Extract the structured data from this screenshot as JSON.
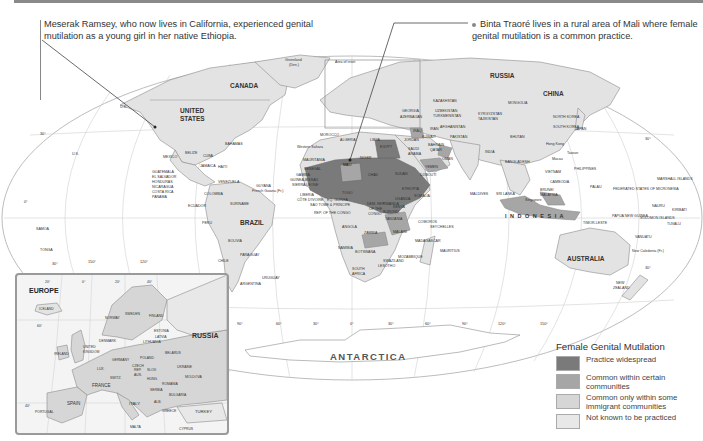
{
  "captions": {
    "left": "Meserak Ramsey, who now lives in California, experienced genital mutilation as a young girl in her native Ethiopia.",
    "right": "Binta Traoré lives in a rural area of Mali where female genital mutilation is a common practice."
  },
  "map": {
    "title_region_labels": {
      "canada": "CANADA",
      "united_states_1": "UNITED",
      "united_states_2": "STATES",
      "mexico": "MEXICO",
      "brazil": "BRAZIL",
      "russia": "RUSSIA",
      "china": "CHINA",
      "india": "INDIA",
      "australia": "AUSTRALIA",
      "antarctica": "ANTARCTICA",
      "indonesia": "I N D O N E S I A",
      "algeria": "ALGERIA",
      "libya": "LIBYA",
      "egypt": "EGYPT",
      "mali": "MALI",
      "niger": "NIGER",
      "chad": "CHAD",
      "sudan": "SUDAN",
      "ethiopia": "ETHIOPIA",
      "somalia": "SOMALIA",
      "kenya": "KENYA",
      "tanzania": "TANZANIA",
      "angola": "ANGOLA",
      "zambia": "ZAMBIA",
      "namibia": "NAMIBIA",
      "botswana": "BOTSWANA",
      "south_africa_1": "SOUTH",
      "south_africa_2": "AFRICA",
      "madagascar": "MADAGASCAR",
      "mozambique": "MOZAMBIQUE",
      "drc_1": "DEM. REP.",
      "drc_2": "OF THE",
      "drc_3": "CONGO",
      "saudi_1": "SAUDI",
      "saudi_2": "ARABIA",
      "yemen": "YEMEN",
      "oman": "OMAN",
      "iran": "IRAN",
      "iraq": "IRAQ",
      "kazakhstan": "KAZAKHSTAN",
      "mongolia": "MONGOLIA",
      "morocco": "MOROCCO",
      "mauritania": "MAURITANIA",
      "western_sahara": "Western Sahara",
      "senegal": "SENEGAL",
      "peru": "PERU",
      "bolivia": "BOLIVIA",
      "chile": "CHILE",
      "argentina": "ARGENTINA",
      "paraguay": "PARAGUAY",
      "uruguay": "URUGUAY",
      "colombia": "COLOMBIA",
      "venezuela": "VENEZUELA",
      "ecuador": "ECUADOR",
      "suriname": "SURINAME",
      "guyana": "GUYANA",
      "french_guiana": "French Guiana (Fr.)",
      "guatemala": "GUATEMALA",
      "el_salvador": "EL SALVADOR",
      "honduras": "HONDURAS",
      "nicaragua": "NICARAGUA",
      "costa_rica": "COSTA RICA",
      "panama": "PANAMA",
      "belize": "BELIZE",
      "cuba": "CUBA",
      "jamaica": "JAMAICA",
      "haiti": "HAITI",
      "bahamas": "BAHAMAS",
      "greenland_1": "Greenland",
      "greenland_2": "(Den.)",
      "area_of_inset": "Area of inset",
      "philippines": "PHILIPPINES",
      "vietnam": "VIETNAM",
      "japan": "JAPAN",
      "north_korea": "NORTH KOREA",
      "south_korea": "SOUTH KOREA",
      "taiwan": "Taiwan",
      "new_zealand_1": "NEW",
      "new_zealand_2": "ZEALAND",
      "papua_new_guinea": "PAPUA NEW GUINEA",
      "solomon": "SOLOMON ISLANDS",
      "marshall": "MARSHALL ISLANDS",
      "micronesia": "FEDERATED STATES OF MICRONESIA",
      "palau": "PALAU",
      "nauru": "NAURU",
      "kiribati": "KIRIBATI",
      "tuvalu": "TUVALU",
      "vanuatu": "VANUATU",
      "new_caledonia": "New Caledonia (Fr.)",
      "samoa": "SAMOA",
      "tonga": "TONGA",
      "us_alaska": "U.S.",
      "us_hawaii": "U.S.",
      "maldives": "MALDIVES",
      "sri_lanka": "SRI LANKA",
      "comoros": "COMOROS",
      "seychelles": "SEYCHELLES",
      "mauritius": "MAURITIUS",
      "swaziland": "SWAZILAND",
      "lesotho": "LESOTHO",
      "malawi": "MALAWI",
      "burundi": "BURUNDI",
      "rwanda": "RWANDA",
      "gabon": "GABON",
      "cote_divoire": "CÔTE D'IVOIRE",
      "liberia": "LIBERIA",
      "sierra_leone": "SIERRA LEONE",
      "guinea_bissau": "GUINEA-BISSAU",
      "gambia": "GAMBIA",
      "sao_tome": "SAO TOME & PRINCIPE",
      "rep_congo": "REP. OF THE CONGO",
      "eq_guinea": "EQ. GUINEA",
      "togo": "TOGO",
      "djibouti": "DJIBOUTI",
      "uganda": "UGANDA",
      "bangladesh": "BANGLADESH",
      "bhutan": "BHUTAN",
      "cambodia": "CAMBODIA",
      "brunei": "BRUNEI",
      "malaysia": "MALAYSIA",
      "singapore": "Singapore",
      "hong_kong": "Hong Kong",
      "macau": "Macau",
      "timor_leste": "TIMOR-LESTE",
      "afghanistan": "AFGHANISTAN",
      "pakistan": "PAKISTAN",
      "kuwait": "KUWAIT",
      "bahrain": "BAHRAIN",
      "qatar": "QATAR",
      "jordan": "JORDAN",
      "kyrgyzstan": "KYRGYZSTAN",
      "tajikistan": "TAJIKISTAN",
      "uzbekistan": "UZBEKISTAN",
      "turkmenistan": "TURKMENISTAN",
      "azerbaijan": "AZERBAIJAN",
      "georgia": "GEORGIA"
    },
    "graticule": {
      "lat_labels": [
        "30°",
        "0°",
        "30°",
        "30°",
        "0°",
        "30°"
      ],
      "lon_labels": [
        "150°",
        "120°",
        "90°",
        "60°",
        "30°",
        "0°",
        "30°",
        "60°",
        "90°",
        "120°",
        "150°"
      ]
    }
  },
  "inset": {
    "title": "EUROPE",
    "countries": [
      "ICELAND",
      "NORWAY",
      "SWEDEN",
      "FINLAND",
      "RUSSIA",
      "ESTONIA",
      "LATVIA",
      "LITHUANIA",
      "DENMARK",
      "UNITED KINGDOM",
      "IRELAND",
      "NETH.",
      "BEL.",
      "LUX.",
      "GERMANY",
      "POLAND",
      "BELARUS",
      "UKRAINE",
      "CZECH REP.",
      "SLOV.",
      "AUS.",
      "HUNG.",
      "SWITZ.",
      "FRANCE",
      "SLO.",
      "CROAT.",
      "BOS. & HERZ.",
      "ROMANIA",
      "MOLDOVA",
      "SERBIA",
      "BULGARIA",
      "MONT.",
      "KOS.",
      "ALB.",
      "MAC.",
      "ITALY",
      "GREECE",
      "SPAIN",
      "PORTUGAL",
      "TURKEY",
      "MALTA",
      "CYPRUS"
    ],
    "labels": {
      "iceland": "ICELAND",
      "norway": "NORWAY",
      "sweden": "SWEDEN",
      "finland": "FINLAND",
      "russia": "RUSSIA",
      "estonia": "ESTONIA",
      "latvia": "LATVIA",
      "lithuania": "LITHUANIA",
      "denmark": "DENMARK",
      "uk_1": "UNITED",
      "uk_2": "KINGDOM",
      "ireland": "IRELAND",
      "germany": "GERMANY",
      "poland": "POLAND",
      "belarus": "BELARUS",
      "ukraine": "UKRAINE",
      "czech_1": "CZECH",
      "czech_2": "REP.",
      "slov": "SLOV.",
      "aus": "AUS.",
      "hung": "HUNG.",
      "switz": "SWITZ.",
      "france": "FRANCE",
      "romania": "ROMANIA",
      "moldova": "MOLDOVA",
      "bulgaria": "BULGARIA",
      "italy": "ITALY",
      "greece": "GREECE",
      "spain": "SPAIN",
      "portugal": "PORTUGAL",
      "turkey": "TURKEY",
      "malta": "MALTA",
      "cyprus": "CYPRUS",
      "lux": "LUX.",
      "serbia": "SERBIA",
      "alb": "ALB."
    },
    "graticule": {
      "lon_labels": [
        "20°",
        "0°",
        "20°",
        "40°"
      ],
      "lat_labels": [
        "60°",
        "40°"
      ]
    }
  },
  "legend": {
    "title": "Female Genital Mutilation",
    "items": [
      {
        "label": "Practice widespread",
        "color": "#7a7a7a"
      },
      {
        "label": "Common within certain communities",
        "color": "#a6a6a6"
      },
      {
        "label": "Common only within some immigrant communities",
        "color": "#d6d6d6"
      },
      {
        "label": "Not known to be practiced",
        "color": "#e8e8e8"
      }
    ]
  },
  "colors": {
    "ocean": "#ffffff",
    "land_default": "#e6e6e6",
    "widespread": "#7a7a7a",
    "certain_communities": "#a6a6a6",
    "immigrant": "#d6d6d6",
    "border": "#8c8c8c",
    "graticule": "#c8c8c8"
  }
}
